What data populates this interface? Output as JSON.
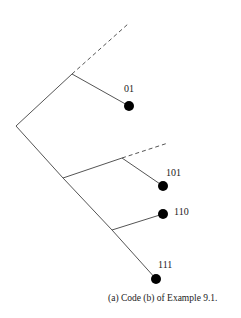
{
  "figure": {
    "caption": "(a) Code (b) of Example 9.1.",
    "style": {
      "line_color": "#555555",
      "node_color": "#000000"
    }
  },
  "tree": {
    "root": {
      "x": 16,
      "y": 126
    },
    "internal_nodes": [
      {
        "id": "n0",
        "x": 72,
        "y": 74
      },
      {
        "id": "n1",
        "x": 63,
        "y": 178
      },
      {
        "id": "n10",
        "x": 122,
        "y": 158
      },
      {
        "id": "n11",
        "x": 112,
        "y": 230
      }
    ],
    "leaves": [
      {
        "label": "01",
        "x": 129,
        "y": 106,
        "label_x": 124,
        "label_y": 84
      },
      {
        "label": "101",
        "x": 163,
        "y": 186,
        "label_x": 166,
        "label_y": 168
      },
      {
        "label": "110",
        "x": 163,
        "y": 214,
        "label_x": 174,
        "label_y": 207
      },
      {
        "label": "111",
        "x": 156,
        "y": 279,
        "label_x": 158,
        "label_y": 260
      }
    ],
    "dashed_branches": [
      {
        "from": "n0",
        "to_x": 128,
        "to_y": 24
      },
      {
        "from": "n10",
        "to_x": 168,
        "to_y": 143
      }
    ]
  }
}
